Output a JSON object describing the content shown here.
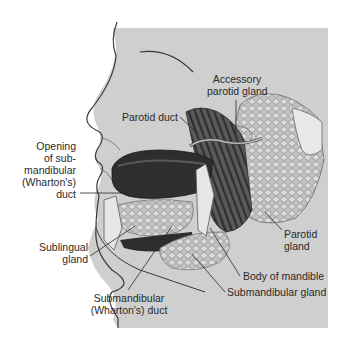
{
  "diagram": {
    "colors": {
      "background_panel": "#cfcfcf",
      "page": "#ffffff",
      "outline": "#3a3a3a",
      "gland": "#bdbdbd",
      "muscle": "#4a4a4a",
      "tongue": "#2e2e2e",
      "bone": "#e6e6e6"
    },
    "labels": {
      "accessory_parotid": [
        "Accessory",
        "parotid gland"
      ],
      "parotid_duct": "Parotid duct",
      "opening": [
        "Opening",
        "of sub-",
        "mandibular",
        "(Wharton's)",
        "duct"
      ],
      "parotid_gland": [
        "Parotid",
        "gland"
      ],
      "sublingual": [
        "Sublingual",
        "gland"
      ],
      "body_mandible": "Body of mandible",
      "submandibular_gland": "Submandibular gland",
      "submandibular_duct": [
        "Submandibular",
        "(Wharton's) duct"
      ]
    }
  }
}
